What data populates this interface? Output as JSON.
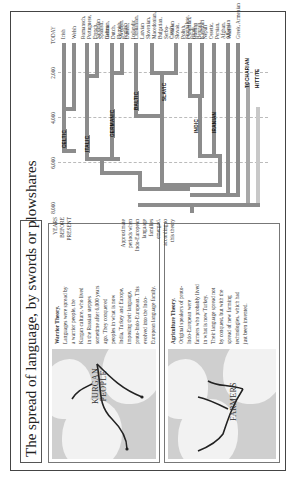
{
  "title": "The spread of language, by swords or plowshares",
  "axis": {
    "label_lines": [
      "YEARS",
      "BEFORE",
      "PRESENT"
    ],
    "ticks": [
      "8,000",
      "6,000",
      "4,000",
      "2,000",
      "TODAY"
    ],
    "note_lines": [
      "Approximate",
      "periods when",
      "Indo-European",
      "language families",
      "emerged,",
      "according to",
      "this theory"
    ]
  },
  "warrior": {
    "heading": "Warrior Theory.",
    "body": "Languages were spread by a warrior people, the Kurgan culture, who lived in the Russian steppes sometime after 6,000 years ago. They conquered peoples in what is now India, Turkey and Europe, imposing their language, proto-Indo-European. This evolved into the Indo-European language family.",
    "map_label_lines": [
      "KURGAN",
      "PEOPLE"
    ]
  },
  "agriculture": {
    "heading": "Agriculture Theory.",
    "body": "Original speakers of proto-Indo-European were farmers who probably lived in what is now Turkey. Their language spread not by conquest, but with the spread of new farming technologies, which had just been invented.",
    "map_label": "FARMERS"
  },
  "tree": {
    "branches": [
      "CELTIC",
      "ITALIC",
      "GERMANIC",
      "BALTIC",
      "SLAVIC",
      "INDIC",
      "IRANIAN",
      "TOCHARIAN",
      "HITTITE"
    ],
    "languages": [
      {
        "text": "Irish"
      },
      {
        "text": "Welsh"
      },
      {
        "text": "Romansch, Portuguese, French, Spanish, Italian"
      },
      {
        "text": "Sardinian"
      },
      {
        "text": "German, Dutch, Flemish, English"
      },
      {
        "text": "Swedish, Danish, Icelandic"
      },
      {
        "text": "Lithuanian, Latvian"
      },
      {
        "text": "Slovenian, Macedonian, Bulgarian, Serbo-Croatian"
      },
      {
        "text": "Czech, Slovak, Polish, Ukrainian, Russian"
      },
      {
        "text": "Singhalese, Hindi, Bengali, Nepali"
      },
      {
        "text": "Kashmiri"
      },
      {
        "text": "Ossetic, Persian, Afghan, Waziri"
      },
      {
        "text": "Albanian"
      },
      {
        "text": "Greek, Armenian"
      }
    ]
  }
}
